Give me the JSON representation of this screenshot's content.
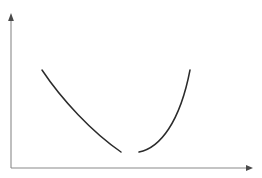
{
  "figure": {
    "kind": "curve-sketch",
    "width": 262,
    "height": 178,
    "background_color": "#ffffff",
    "title": "",
    "caption": "",
    "labels": [],
    "tick_labels": [],
    "legend_entries": []
  },
  "axes": {
    "origin": {
      "x": 11,
      "y": 168
    },
    "color": "#8a8a8a",
    "stroke_width": 1.1,
    "x_axis": {
      "name": "x-axis",
      "label": "",
      "from": {
        "x": 11,
        "y": 168
      },
      "to": {
        "x": 246,
        "y": 168
      },
      "arrow": true,
      "arrow_tip": {
        "x": 253,
        "y": 168
      },
      "ticks": []
    },
    "y_axis": {
      "name": "y-axis",
      "label": "",
      "from": {
        "x": 11,
        "y": 168
      },
      "to": {
        "x": 11,
        "y": 21
      },
      "arrow": true,
      "arrow_tip": {
        "x": 11,
        "y": 13
      },
      "ticks": []
    }
  },
  "chart_data": {
    "type": "line",
    "title": "",
    "xlabel": "",
    "ylabel": "",
    "grid": false,
    "legend_position": "none",
    "xlim": [
      11,
      253
    ],
    "ylim": [
      168,
      13
    ],
    "axis_values_shown": false,
    "series": [
      {
        "name": "left-branch",
        "color": "#2b2b2b",
        "stroke_width": 1.5,
        "description": "descending concave-up branch from upper-left down to the gap",
        "path": "M 42 70 C 62 100 92 132 121 152",
        "points": [
          {
            "x": 42,
            "y": 70
          },
          {
            "x": 56,
            "y": 88
          },
          {
            "x": 70,
            "y": 105
          },
          {
            "x": 84,
            "y": 120
          },
          {
            "x": 98,
            "y": 134
          },
          {
            "x": 110,
            "y": 144
          },
          {
            "x": 121,
            "y": 152
          }
        ]
      },
      {
        "name": "right-branch",
        "color": "#2b2b2b",
        "stroke_width": 1.5,
        "description": "ascending concave-up branch from the gap up to the upper-right",
        "path": "M 139 152 C 160 148 180 122 190 70",
        "points": [
          {
            "x": 139,
            "y": 152
          },
          {
            "x": 150,
            "y": 150
          },
          {
            "x": 162,
            "y": 143
          },
          {
            "x": 172,
            "y": 130
          },
          {
            "x": 180,
            "y": 112
          },
          {
            "x": 186,
            "y": 92
          },
          {
            "x": 190,
            "y": 70
          }
        ]
      }
    ],
    "gap": {
      "name": "discontinuity-gap",
      "from_x": 121,
      "to_x": 139,
      "at_y": 152
    }
  }
}
